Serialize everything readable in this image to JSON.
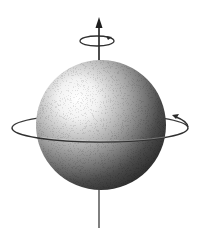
{
  "figure": {
    "background": "#ffffff",
    "ink": "#2a2a2a",
    "sphere": {
      "cx": 101,
      "cy": 125,
      "r": 65,
      "highlight": "#ffffff",
      "shadow": "#1a1a1a"
    },
    "axis": {
      "x": 99,
      "y_top": 20,
      "y_bottom": 228
    },
    "top_ring": {
      "cx": 97,
      "cy": 41,
      "rx": 17,
      "ry": 5
    },
    "equator_ring": {
      "cx": 100,
      "cy": 128,
      "rx": 88,
      "ry": 14
    }
  },
  "icons": [
    "axis-arrow-icon",
    "rotation-arrow-icon",
    "orbit-ring-icon"
  ]
}
